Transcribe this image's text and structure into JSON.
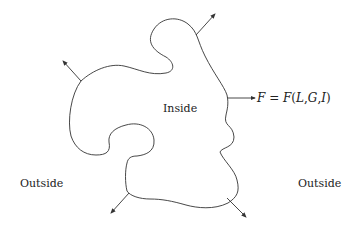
{
  "labels": {
    "inside": "Inside",
    "outside_left": "Outside",
    "outside_right": "Outside"
  },
  "equation": {
    "lhs": "F",
    "eq": " = ",
    "fn": "F",
    "open": "(",
    "a1": "L",
    "c1": ",",
    "a2": "G",
    "c2": ",",
    "a3": "I",
    "close": ")"
  },
  "colors": {
    "stroke": "#333333",
    "text": "#222222"
  }
}
